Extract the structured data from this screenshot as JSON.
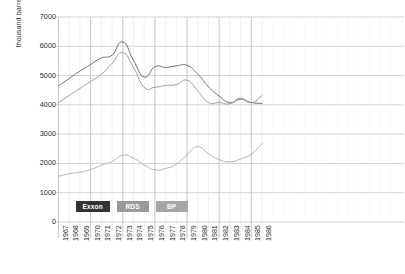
{
  "chart_data": {
    "type": "line",
    "title": "",
    "xlabel": "",
    "ylabel": "thousand barrels per day",
    "x": [
      1967,
      1968,
      1969,
      1970,
      1971,
      1972,
      1973,
      1974,
      1975,
      1976,
      1977,
      1978,
      1979,
      1980,
      1981,
      1982,
      1983,
      1984,
      1985,
      1986
    ],
    "xtick_labels": [
      "1967",
      "1968",
      "1969",
      "1970",
      "1971",
      "1972",
      "1973",
      "1974",
      "1975",
      "1976",
      "1977",
      "1978",
      "1979",
      "1980",
      "1981",
      "1982",
      "1983",
      "1984",
      "1985",
      "1986"
    ],
    "ytick_labels": [
      "0",
      "1000",
      "2000",
      "3000",
      "4000",
      "5000",
      "6000",
      "7000"
    ],
    "ytick_values": [
      0,
      1000,
      2000,
      3000,
      4000,
      5000,
      6000,
      7000
    ],
    "ylim": [
      0,
      7000
    ],
    "grid": true,
    "grid_horizontal": true,
    "grid_vertical": true,
    "legend_position": "inside-bottom-left",
    "series": [
      {
        "name": "Exxon",
        "color": "#595959",
        "values": [
          4650,
          4900,
          5150,
          5380,
          5600,
          5700,
          6150,
          5520,
          4950,
          5300,
          5280,
          5330,
          5350,
          5050,
          4620,
          4300,
          4080,
          4190,
          4080,
          4050
        ]
      },
      {
        "name": "RDS",
        "color": "#8c8c8c",
        "values": [
          4080,
          4320,
          4560,
          4800,
          5040,
          5420,
          5780,
          5280,
          4600,
          4600,
          4660,
          4690,
          4840,
          4480,
          4080,
          4080,
          4040,
          4230,
          4070,
          4320
        ]
      },
      {
        "name": "BP",
        "color": "#a6a6a6",
        "values": [
          1560,
          1650,
          1700,
          1790,
          1940,
          2060,
          2280,
          2180,
          1950,
          1780,
          1830,
          1980,
          2300,
          2570,
          2330,
          2130,
          2060,
          2150,
          2320,
          2680
        ]
      }
    ]
  },
  "legend": {
    "items": [
      {
        "label": "Exxon",
        "color": "#333333"
      },
      {
        "label": "RDS",
        "color": "#999999"
      },
      {
        "label": "BP",
        "color": "#a6a6a6"
      }
    ]
  },
  "colors": {
    "grid": "#d9d9d9",
    "grid_major": "#b3b3b3",
    "axis_text": "#2b2b2b",
    "background": "#ffffff"
  }
}
